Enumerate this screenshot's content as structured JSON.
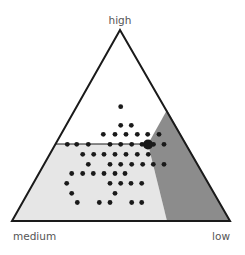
{
  "chart_data": {
    "type": "scatter",
    "subtype": "ternary",
    "title": "",
    "vertex_labels": {
      "top": "high",
      "bottom_left": "medium",
      "bottom_right": "low"
    },
    "triangle": {
      "apex": [
        120,
        30
      ],
      "bottom_left": [
        12,
        221
      ],
      "bottom_right": [
        230,
        221
      ]
    },
    "regions": [
      {
        "name": "light-region",
        "color": "#e6e6e6",
        "polygon": [
          [
            56,
            144
          ],
          [
            148,
            144
          ],
          [
            167,
            221
          ],
          [
            12,
            221
          ]
        ]
      },
      {
        "name": "dark-region",
        "color": "#8c8c8c",
        "polygon": [
          [
            167,
            110
          ],
          [
            230,
            221
          ],
          [
            167,
            221
          ],
          [
            148,
            144
          ]
        ]
      }
    ],
    "divider_line": {
      "from": [
        56,
        144
      ],
      "to": [
        150,
        144
      ]
    },
    "highlight_point": {
      "x": 148,
      "y": 144.5,
      "r": 5
    },
    "points": [
      [
        120.7,
        106.7
      ],
      [
        120.7,
        125.3
      ],
      [
        131.3,
        125.3
      ],
      [
        103.3,
        134.3
      ],
      [
        115,
        134.3
      ],
      [
        126,
        134.3
      ],
      [
        137.3,
        134.3
      ],
      [
        147.7,
        134.3
      ],
      [
        159,
        134.3
      ],
      [
        67.3,
        144.3
      ],
      [
        76.7,
        144.3
      ],
      [
        88.3,
        144.3
      ],
      [
        110,
        144.3
      ],
      [
        120.7,
        144.3
      ],
      [
        131.7,
        144.3
      ],
      [
        142,
        144.3
      ],
      [
        153.5,
        144.3
      ],
      [
        164,
        144.3
      ],
      [
        82.7,
        154.3
      ],
      [
        93.7,
        154.3
      ],
      [
        104,
        154.3
      ],
      [
        115,
        154.3
      ],
      [
        126,
        154.3
      ],
      [
        137.3,
        154.3
      ],
      [
        148.3,
        154.3
      ],
      [
        88.3,
        164.3
      ],
      [
        110,
        164.3
      ],
      [
        120.7,
        164.3
      ],
      [
        131.7,
        164.3
      ],
      [
        142.7,
        164.3
      ],
      [
        153.3,
        164.3
      ],
      [
        164,
        164.3
      ],
      [
        71.7,
        173.5
      ],
      [
        82.7,
        173.5
      ],
      [
        93.3,
        173.5
      ],
      [
        104,
        173.5
      ],
      [
        115,
        173.5
      ],
      [
        125,
        173.5
      ],
      [
        66.7,
        183.3
      ],
      [
        110,
        183.3
      ],
      [
        120.7,
        183.3
      ],
      [
        131,
        183.3
      ],
      [
        141.7,
        183.3
      ],
      [
        71.7,
        193.3
      ],
      [
        115,
        193.3
      ],
      [
        77.3,
        202.5
      ],
      [
        99.3,
        202.5
      ],
      [
        110,
        202.5
      ],
      [
        131.7,
        202.5
      ],
      [
        141.7,
        202.5
      ]
    ],
    "point_radius": 2.4,
    "point_color": "#1a1a1a",
    "outline_color": "#1a1a1a"
  },
  "labels": {
    "top": "high",
    "bottom_left": "medium",
    "bottom_right": "low"
  }
}
